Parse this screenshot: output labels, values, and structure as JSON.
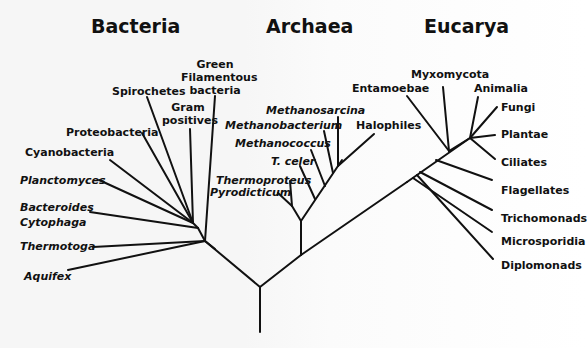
{
  "diagram": {
    "type": "phylogenetic-tree",
    "line_color": "#111111",
    "domains": [
      {
        "name": "Bacteria",
        "x": 91,
        "y": 16
      },
      {
        "name": "Archaea",
        "x": 266,
        "y": 16
      },
      {
        "name": "Eucarya",
        "x": 424,
        "y": 16
      }
    ],
    "bacteria": {
      "green_filamentous": [
        "Green",
        "Filamentous",
        "bacteria"
      ],
      "spirochetes": "Spirochetes",
      "gram_positives": [
        "Gram",
        "positives"
      ],
      "proteobacteria": "Proteobacteria",
      "cyanobacteria": "Cyanobacteria",
      "planctomyces": "Planctomyces",
      "bacteroides": [
        "Bacteroides",
        "Cytophaga"
      ],
      "thermotoga": "Thermotoga",
      "aquifex": "Aquifex"
    },
    "archaea": {
      "methanosarcina": "Methanosarcina",
      "methanobacterium": "Methanobacterium",
      "methanococcus": "Methanococcus",
      "t_celer": "T. celer",
      "thermoproteus": "Thermoproteus",
      "pyrodicticum": "Pyrodicticum",
      "halophiles": "Halophiles"
    },
    "eucarya": {
      "entamoebae": "Entamoebae",
      "myxomycota": "Myxomycota",
      "animalia": "Animalia",
      "fungi": "Fungi",
      "plantae": "Plantae",
      "ciliates": "Ciliates",
      "flagellates": "Flagellates",
      "trichomonads": "Trichomonads",
      "microsporidia": "Microsporidia",
      "diplomonads": "Diplomonads"
    }
  }
}
